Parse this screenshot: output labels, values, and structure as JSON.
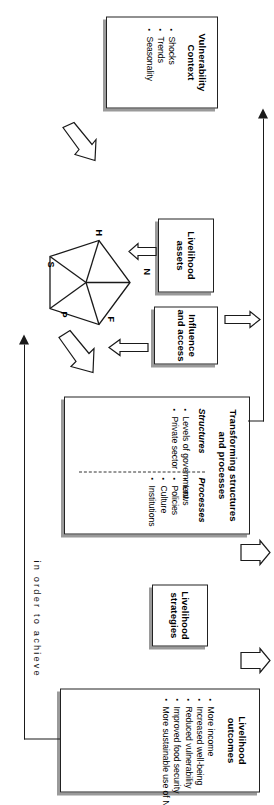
{
  "diagram": {
    "caption": "in order to achieve",
    "vulnerability": {
      "heading_line1": "Vulnerability",
      "heading_line2": "Context",
      "items": [
        "Shocks",
        "Trends",
        "Seasonality"
      ]
    },
    "assets": {
      "heading_line1": "Livelihood",
      "heading_line2": "assets",
      "pentagon_labels": {
        "human": "H",
        "natural": "N",
        "financial": "F",
        "physical": "P",
        "social": "S"
      }
    },
    "influence": {
      "heading_line1": "Influence",
      "heading_line2": "and access"
    },
    "transforming": {
      "heading_line1": "Transforming structures",
      "heading_line2": "and processes",
      "structures_label": "Structures",
      "structures_items": [
        "Levels of government",
        "Private sector"
      ],
      "processes_label": "Processes",
      "processes_items": [
        "Laws",
        "Policies",
        "Culture",
        "Institutions"
      ]
    },
    "strategies": {
      "heading_line1": "Livelihood",
      "heading_line2": "strategies"
    },
    "outcomes": {
      "heading_line1": "Livelihood",
      "heading_line2": "outcomes",
      "items": [
        "More income",
        "Increased well-being",
        "Reduced vulnerability",
        "Improved food security",
        "More sustainable use of NR base"
      ]
    },
    "colors": {
      "line": "#1a1a1a",
      "box_border": "#222222",
      "shadow": "#9a9a9a",
      "background": "#ffffff"
    }
  }
}
